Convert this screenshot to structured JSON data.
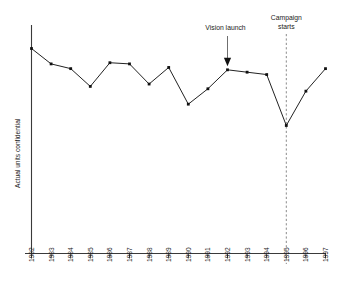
{
  "chart_data": {
    "type": "line",
    "title": "",
    "subtitle": "",
    "xlabel": "",
    "ylabel": "Actual units confidential",
    "grid": false,
    "legend": "none",
    "axis": {
      "x_range": [
        1982,
        1997
      ],
      "y_range_note": "unlabeled / confidential scale",
      "y_ticks": [],
      "x_ticks_rotated_deg": -90
    },
    "categories": [
      "1982",
      "1983",
      "1984",
      "1985",
      "1986",
      "1987",
      "1988",
      "1989",
      "1990",
      "1991",
      "1992",
      "1993",
      "1994",
      "1995",
      "1996",
      "1997"
    ],
    "series": [
      {
        "name": "Actual units",
        "values": [
          100,
          87,
          83,
          68,
          88,
          87,
          70,
          84,
          53,
          66,
          82,
          80,
          78,
          35,
          64,
          83
        ]
      }
    ],
    "annotations": [
      {
        "id": "vision-launch",
        "label": "Vision launch",
        "target_category": "1992",
        "kind": "arrow-down"
      },
      {
        "id": "campaign-starts",
        "label_line1": "Campaign",
        "label_line2": "starts",
        "target_category": "1995",
        "kind": "dashed-vertical-line"
      }
    ],
    "colors": {
      "line": "#222222",
      "marker": "#111111",
      "axis": "#3a3a3a",
      "dashed_guide": "#8a8a8a",
      "arrow_shaft": "#6f6f6f",
      "background": "#ffffff",
      "text": "#1a1a1a"
    }
  }
}
